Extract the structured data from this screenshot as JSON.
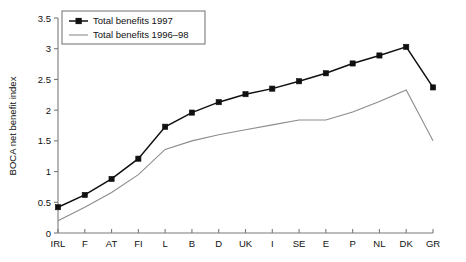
{
  "chart_data": {
    "type": "line",
    "title": "",
    "xlabel": "",
    "ylabel": "BOCA net benefit index",
    "categories": [
      "IRL",
      "F",
      "AT",
      "FI",
      "L",
      "B",
      "D",
      "UK",
      "I",
      "SE",
      "E",
      "P",
      "NL",
      "DK",
      "GR"
    ],
    "ylim": [
      0,
      3.5
    ],
    "yticks": [
      0,
      0.5,
      1,
      1.5,
      2,
      2.5,
      3,
      3.5
    ],
    "yticklabels": [
      "0",
      "0.5",
      "1",
      "1.5",
      "2",
      "2.5",
      "3",
      "3.5"
    ],
    "grid": false,
    "legend_position": "top-left",
    "series": [
      {
        "name": "Total benefits 1997",
        "marker": "square",
        "color": "#101010",
        "values": [
          0.42,
          0.62,
          0.88,
          1.21,
          1.73,
          1.96,
          2.13,
          2.26,
          2.35,
          2.47,
          2.6,
          2.76,
          2.89,
          3.03,
          2.37
        ]
      },
      {
        "name": "Total benefits 1996–98",
        "marker": "none",
        "color": "#8c8c8c",
        "values": [
          0.2,
          0.42,
          0.66,
          0.95,
          1.36,
          1.5,
          1.6,
          1.68,
          1.76,
          1.84,
          1.84,
          1.97,
          2.14,
          2.33,
          1.5
        ]
      }
    ]
  },
  "legend": {
    "items": [
      {
        "label": "Total benefits 1997"
      },
      {
        "label": "Total benefits 1996–98"
      }
    ]
  },
  "axes": {
    "y_axis_title": "BOCA net benefit index"
  }
}
